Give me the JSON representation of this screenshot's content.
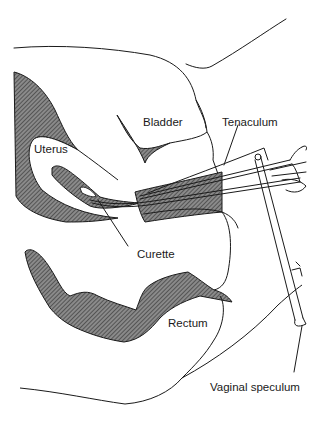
{
  "diagram": {
    "style": {
      "ink": "#1a1a1a",
      "hatch_fill": "#6b6b6b",
      "background": "#ffffff"
    },
    "labels": [
      {
        "id": "bladder",
        "text": "Bladder",
        "x": 143,
        "y": 117
      },
      {
        "id": "tenaculum",
        "text": "Tenaculum",
        "x": 222,
        "y": 117
      },
      {
        "id": "uterus",
        "text": "Uterus",
        "x": 34,
        "y": 144
      },
      {
        "id": "curette",
        "text": "Curette",
        "x": 137,
        "y": 249
      },
      {
        "id": "rectum",
        "text": "Rectum",
        "x": 168,
        "y": 318
      },
      {
        "id": "vaginal_speculum",
        "text": "Vaginal speculum",
        "x": 210,
        "y": 382
      }
    ]
  }
}
